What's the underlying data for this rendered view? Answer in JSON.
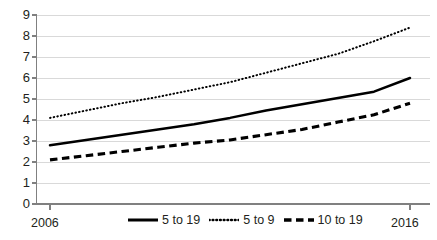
{
  "chart_data": {
    "type": "line",
    "title": "",
    "xlabel": "",
    "ylabel": "",
    "xlim": [
      2006,
      2016
    ],
    "ylim": [
      0,
      9
    ],
    "ytick_labels": [
      "9",
      "8",
      "7",
      "6",
      "5",
      "4",
      "3",
      "2",
      "1",
      "0"
    ],
    "ytick_values": [
      9,
      8,
      7,
      6,
      5,
      4,
      3,
      2,
      1,
      0
    ],
    "xtick_labels": [
      "2006",
      "2016"
    ],
    "xtick_values": [
      2006,
      2016
    ],
    "grid": "horizontal",
    "legend_position": "bottom-center",
    "x": [
      2006,
      2007,
      2008,
      2009,
      2010,
      2011,
      2012,
      2013,
      2014,
      2015,
      2016
    ],
    "series": [
      {
        "name": "5 to 19",
        "style": "solid",
        "color": "#000000",
        "values": [
          2.8,
          3.05,
          3.3,
          3.55,
          3.8,
          4.1,
          4.45,
          4.75,
          5.05,
          5.35,
          6.0
        ]
      },
      {
        "name": "5 to 9",
        "style": "dotted",
        "color": "#000000",
        "values": [
          4.1,
          4.45,
          4.8,
          5.1,
          5.45,
          5.8,
          6.25,
          6.7,
          7.15,
          7.75,
          8.4
        ]
      },
      {
        "name": "10 to 19",
        "style": "dashed",
        "color": "#000000",
        "values": [
          2.1,
          2.3,
          2.5,
          2.7,
          2.9,
          3.05,
          3.3,
          3.55,
          3.9,
          4.25,
          4.8
        ]
      }
    ]
  },
  "legend": {
    "items": [
      {
        "label": "5 to 19",
        "style": "solid"
      },
      {
        "label": "5 to 9",
        "style": "dotted"
      },
      {
        "label": "10 to 19",
        "style": "dashed"
      }
    ]
  },
  "colors": {
    "line": "#000000",
    "grid": "#d9d9d9",
    "axis": "#808080",
    "text": "#231f20",
    "background": "#ffffff"
  }
}
